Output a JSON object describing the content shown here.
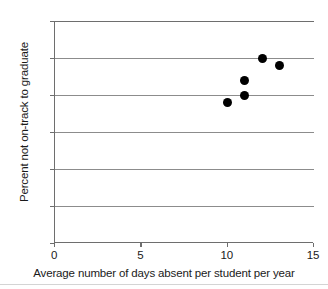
{
  "chart_data": {
    "type": "scatter",
    "title": "",
    "xlabel": "Average number of days absent per student per year",
    "ylabel": "Percent not on-track to graduate",
    "xlim": [
      0,
      15
    ],
    "ylim": [
      0,
      30
    ],
    "xticks": [
      0,
      5,
      10,
      15
    ],
    "xtick_labels": [
      "0",
      "5",
      "10",
      "15"
    ],
    "yticks": [
      0,
      5,
      10,
      15,
      20,
      25,
      30
    ],
    "ytick_labels": [
      "0%",
      "5%",
      "10%",
      "15%",
      "20%",
      "25%",
      "30%"
    ],
    "grid": "horizontal",
    "legend": "none",
    "marker": {
      "shape": "circle",
      "color": "#000000",
      "size_px": 9
    },
    "points": [
      {
        "x": 10,
        "y": 19
      },
      {
        "x": 11,
        "y": 20
      },
      {
        "x": 11,
        "y": 22
      },
      {
        "x": 12,
        "y": 25
      },
      {
        "x": 13,
        "y": 24
      }
    ],
    "colors": {
      "marker": "#000000",
      "gridline": "#8c8c8c",
      "axis": "#6e6e6e",
      "text": "#1a1a1a",
      "background": "#ffffff",
      "footer_rule": "#d4d4d4"
    }
  }
}
